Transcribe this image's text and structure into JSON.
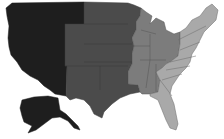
{
  "map": {
    "subject": "United States regional map",
    "style": "grayscale choropleth",
    "regions": [
      {
        "id": "west",
        "name": "West (Pacific & Mountain) + Alaska",
        "fill": "#1e1e1e",
        "stroke": "#1e1e1e"
      },
      {
        "id": "plains",
        "name": "Central Plains",
        "fill": "#4b4b4b",
        "stroke": "#3e3e3e"
      },
      {
        "id": "midwest-south",
        "name": "Midwest & Mid-South",
        "fill": "#7c7c7c",
        "stroke": "#555555"
      },
      {
        "id": "east",
        "name": "East Coast",
        "fill": "#a9a9a9",
        "stroke": "#6a6a6a"
      }
    ],
    "background": "#ffffff"
  }
}
